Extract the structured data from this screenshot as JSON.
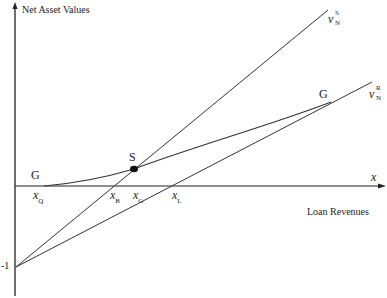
{
  "diagram": {
    "y_axis_label": "Net Asset Values",
    "x_axis_label": "Loan Revenues",
    "x_axis_symbol": "x",
    "y_intercept_label": "-1",
    "curves": [
      {
        "name": "v_N^S",
        "symbol": "v",
        "sub": "N",
        "sup": "S",
        "type": "line",
        "from": [
          0,
          -1
        ],
        "description": "steeper line from -1"
      },
      {
        "name": "v_N^R",
        "symbol": "v",
        "sub": "N",
        "sup": "R",
        "type": "line",
        "from": [
          0,
          -1
        ],
        "description": "flatter line from -1"
      },
      {
        "name": "G",
        "label": "G",
        "type": "curve",
        "description": "convex-then-concave curve starting at x_Q, passing through S"
      }
    ],
    "points": {
      "S": "S"
    },
    "curve_labels": {
      "G_left": "G",
      "G_right": "G"
    },
    "x_ticks": [
      {
        "symbol": "x",
        "sub": "Q"
      },
      {
        "symbol": "x",
        "sub": "B"
      },
      {
        "symbol": "x",
        "sub": "G"
      },
      {
        "symbol": "x",
        "sub": "L"
      }
    ]
  }
}
